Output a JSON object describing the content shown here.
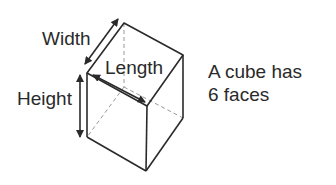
{
  "labels": {
    "width": "Width",
    "length": "Length",
    "height": "Height"
  },
  "caption": {
    "line1": "A cube has",
    "line2": "6 faces"
  },
  "colors": {
    "line": "#2a2a2a",
    "hidden": "#999999"
  }
}
